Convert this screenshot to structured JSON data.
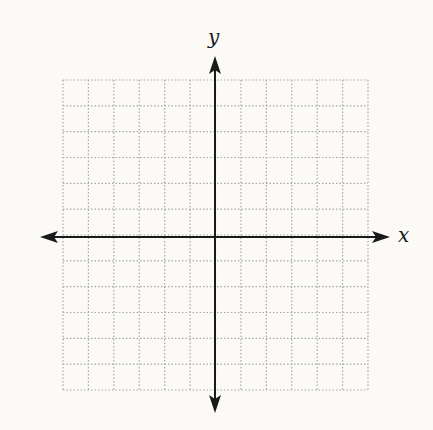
{
  "diagram": {
    "type": "coordinate-plane",
    "grid": {
      "columns": 12,
      "rows": 12,
      "left": 63,
      "top": 80,
      "right": 368,
      "bottom": 390,
      "line_style": "dotted",
      "line_color": "#a8a8a8"
    },
    "axes": {
      "origin_x": 215,
      "origin_y": 237,
      "color": "#1a1a1a",
      "x_axis": {
        "label": "x",
        "left_tip": 40,
        "right_tip": 390
      },
      "y_axis": {
        "label": "y",
        "top_tip": 56,
        "bottom_tip": 413
      }
    }
  }
}
